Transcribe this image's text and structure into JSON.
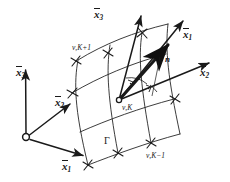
{
  "figure": {
    "kind": "engineering-diagram",
    "ink_color": "#1a1a1a",
    "background_color": "#ffffff"
  },
  "global_axes": {
    "origin_marker": "open-circle",
    "x1": {
      "symbol": "x",
      "index": "1",
      "overbar": true
    },
    "x2": {
      "symbol": "x",
      "index": "2",
      "overbar": true
    },
    "x3": {
      "symbol": "x",
      "index": "3",
      "overbar": true
    }
  },
  "local_axes": {
    "x1": {
      "symbol": "x",
      "index": "1",
      "overbar": true
    },
    "x2": {
      "symbol": "x",
      "index": "2",
      "overbar": true
    },
    "x3": {
      "symbol": "x",
      "index": "3",
      "overbar": true
    }
  },
  "normal": {
    "symbol": "n"
  },
  "surface": {
    "symbol": "Γ"
  },
  "nodes": [
    {
      "id": "node-k-plus-1",
      "label": "ν,K+1"
    },
    {
      "id": "node-k",
      "label": "ν,K"
    },
    {
      "id": "node-k-minus-1",
      "label": "ν,K−1"
    }
  ],
  "right_angle_marks": 2
}
